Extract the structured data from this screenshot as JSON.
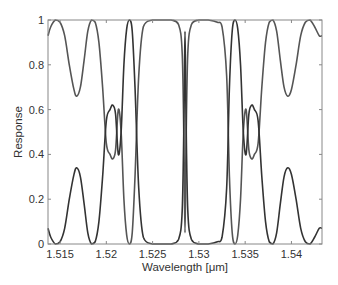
{
  "chart_data": {
    "type": "line",
    "title": "",
    "xlabel": "Wavelength [μm]",
    "ylabel": "Response",
    "xlim": [
      1.5137,
      1.5433
    ],
    "ylim": [
      0,
      1
    ],
    "xticks": [
      1.515,
      1.52,
      1.525,
      1.53,
      1.535,
      1.54
    ],
    "xtick_labels": [
      "1.515",
      "1.52",
      "1.525",
      "1.53",
      "1.535",
      "1.54"
    ],
    "yticks": [
      0,
      0.2,
      0.4,
      0.6,
      0.8,
      1
    ],
    "ytick_labels": [
      "0",
      "0.2",
      "0.4",
      "0.6",
      "0.8",
      "1"
    ],
    "grid": false,
    "legend": null,
    "series": [
      {
        "name": "through",
        "color": "#555555",
        "x": [
          1.5137,
          1.514,
          1.5145,
          1.515,
          1.5155,
          1.516,
          1.5165,
          1.5168,
          1.5172,
          1.5176,
          1.518,
          1.5184,
          1.5188,
          1.5192,
          1.5196,
          1.52,
          1.5204,
          1.5207,
          1.521,
          1.5213,
          1.5216,
          1.5219,
          1.5222,
          1.5225,
          1.5228,
          1.5231,
          1.5235,
          1.524,
          1.525,
          1.526,
          1.527,
          1.5278,
          1.5282,
          1.5284,
          1.5285,
          1.5286,
          1.5288,
          1.5292,
          1.53,
          1.531,
          1.532,
          1.5325,
          1.533,
          1.5333,
          1.5336,
          1.5339,
          1.5342,
          1.5345,
          1.5348,
          1.5351,
          1.5354,
          1.5357,
          1.536,
          1.5364,
          1.5368,
          1.5372,
          1.5376,
          1.538,
          1.5384,
          1.5388,
          1.5392,
          1.5396,
          1.54,
          1.5405,
          1.541,
          1.5415,
          1.542,
          1.5425,
          1.543,
          1.5433
        ],
        "y": [
          0.93,
          0.97,
          1.0,
          0.99,
          0.93,
          0.8,
          0.69,
          0.66,
          0.7,
          0.82,
          0.95,
          1.0,
          0.99,
          0.9,
          0.7,
          0.45,
          0.4,
          0.38,
          0.42,
          0.6,
          0.5,
          0.2,
          0.04,
          0.0,
          0.05,
          0.3,
          0.75,
          0.97,
          1.0,
          1.0,
          1.0,
          0.98,
          0.85,
          0.4,
          0.05,
          0.4,
          0.85,
          0.98,
          1.0,
          1.0,
          0.99,
          0.97,
          0.75,
          0.3,
          0.05,
          0.0,
          0.04,
          0.2,
          0.5,
          0.6,
          0.42,
          0.38,
          0.4,
          0.45,
          0.7,
          0.9,
          0.99,
          1.0,
          0.95,
          0.82,
          0.7,
          0.66,
          0.69,
          0.8,
          0.93,
          0.99,
          1.0,
          0.97,
          0.93,
          0.93
        ]
      },
      {
        "name": "drop",
        "color": "#333333",
        "note": "complement of through (1 - through)"
      }
    ],
    "features": {
      "central_notch_wavelength": 1.5285,
      "side_lobe_peak_low_curve": 0.33,
      "side_lobe_dip_high_curve": 0.66,
      "crossing_region_peak": 0.62
    }
  },
  "axes": {
    "xlabel": "Wavelength [μm]",
    "ylabel": "Response"
  }
}
